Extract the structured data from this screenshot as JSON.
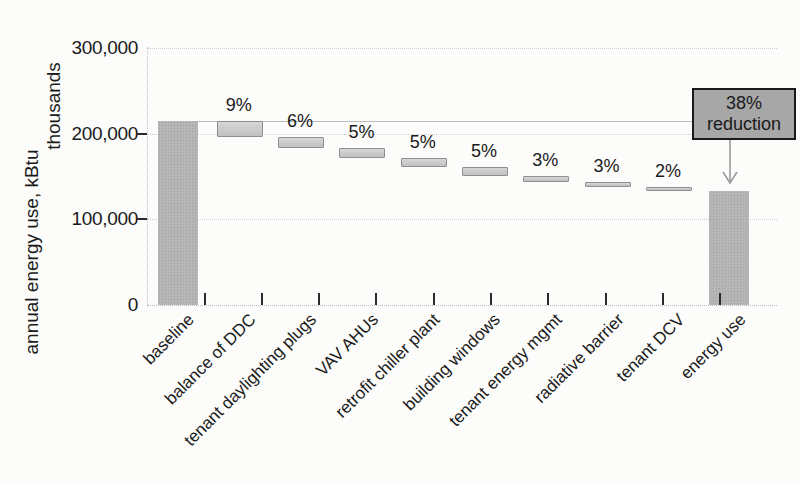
{
  "chart_data": {
    "type": "bar",
    "subtype": "waterfall",
    "title": "",
    "xlabel": "",
    "ylabel": "annual energy use, kBtu",
    "y_unit_label": "thousands",
    "ylim": [
      0,
      300000
    ],
    "grid": true,
    "legend": "none",
    "yticks": [
      {
        "value": 0,
        "label": "0"
      },
      {
        "value": 100000,
        "label": "100,000"
      },
      {
        "value": 200000,
        "label": "200,000"
      },
      {
        "value": 300000,
        "label": "300,000"
      }
    ],
    "baseline_reference_value": 215000,
    "categories": [
      "baseline",
      "balance of DDC",
      "tenant daylighting plugs",
      "VAV AHUs",
      "retrofit chiller plant",
      "building windows",
      "tenant energy mgmt",
      "radiative barrier",
      "tenant DCV",
      "energy use"
    ],
    "steps": [
      {
        "label": "baseline",
        "kind": "total",
        "start": 0,
        "end": 215000,
        "pct": null
      },
      {
        "label": "balance of DDC",
        "kind": "decrease",
        "start": 215000,
        "end": 195650,
        "pct": "9%"
      },
      {
        "label": "tenant daylighting plugs",
        "kind": "decrease",
        "start": 195650,
        "end": 182750,
        "pct": "6%"
      },
      {
        "label": "VAV AHUs",
        "kind": "decrease",
        "start": 182750,
        "end": 172000,
        "pct": "5%"
      },
      {
        "label": "retrofit chiller plant",
        "kind": "decrease",
        "start": 172000,
        "end": 161250,
        "pct": "5%"
      },
      {
        "label": "building windows",
        "kind": "decrease",
        "start": 161250,
        "end": 150500,
        "pct": "5%"
      },
      {
        "label": "tenant energy mgmt",
        "kind": "decrease",
        "start": 150500,
        "end": 144050,
        "pct": "3%"
      },
      {
        "label": "radiative barrier",
        "kind": "decrease",
        "start": 144050,
        "end": 137600,
        "pct": "3%"
      },
      {
        "label": "tenant DCV",
        "kind": "decrease",
        "start": 137600,
        "end": 133300,
        "pct": "2%"
      },
      {
        "label": "energy use",
        "kind": "total",
        "start": 0,
        "end": 133300,
        "pct": null
      }
    ],
    "annotation": {
      "line1": "38%",
      "line2": "reduction"
    },
    "colors": {
      "total_bar": "#b6b6b6",
      "change_bar": "#cbcbcb",
      "change_bar_border": "#8f8f8f",
      "annotation_fill": "#a7a7a7",
      "annotation_border": "#1a1a1a",
      "gridline": "#cccccc",
      "reference_line": "#bcbcbc",
      "arrow": "#9a9a9a",
      "text": "#1a1a1a"
    }
  }
}
